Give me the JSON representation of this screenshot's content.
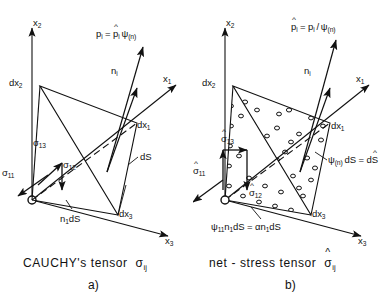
{
  "figure": {
    "title_hidden": "",
    "panels": [
      {
        "id": "a",
        "caption": "CAUCHY's tensor",
        "caption_symbol": "σ",
        "caption_symbol_sub": "ij",
        "sublabel": "a)",
        "axes": [
          {
            "name": "axis-x2",
            "label": "x",
            "sub": "2"
          },
          {
            "name": "axis-x1",
            "label": "x",
            "sub": "1"
          },
          {
            "name": "axis-x3",
            "label": "x",
            "sub": "3"
          }
        ],
        "vertices": [
          {
            "name": "vertex-dx2",
            "label": "dx",
            "sub": "2"
          },
          {
            "name": "vertex-dx1",
            "label": "dx",
            "sub": "1"
          },
          {
            "name": "vertex-dx3",
            "label": "dx",
            "sub": "3"
          }
        ],
        "traction_label": "pᵢ = p̂ᵢ ψ(n)",
        "traction_parts": {
          "lhs": "p",
          "lhs_sub": "i",
          "eq": "=",
          "rhs_sym": "p",
          "rhs_sub": "i",
          "factor": "ψ",
          "factor_sub": "(n)"
        },
        "normal_label": {
          "sym": "n",
          "sub": "i"
        },
        "stress_arrows": [
          {
            "name": "stress-sigma-13",
            "sym": "σ",
            "sub": "13",
            "hat": false
          },
          {
            "name": "stress-sigma-12",
            "sym": "σ",
            "sub": "12",
            "hat": false
          },
          {
            "name": "stress-sigma-11",
            "sym": "σ",
            "sub": "11",
            "hat": false
          }
        ],
        "area_label": "dS",
        "base_label": {
          "sym": "n",
          "sub": "1",
          "tail": "dS"
        },
        "shaded": false
      },
      {
        "id": "b",
        "caption": "net - stress  tensor",
        "caption_symbol": "σ",
        "caption_symbol_sub": "ij",
        "caption_symbol_hat": true,
        "sublabel": "b)",
        "axes": [
          {
            "name": "axis-x2",
            "label": "x",
            "sub": "2"
          },
          {
            "name": "axis-x1",
            "label": "x",
            "sub": "1"
          },
          {
            "name": "axis-x3",
            "label": "x",
            "sub": "3"
          }
        ],
        "vertices": [
          {
            "name": "vertex-dx2",
            "label": "dx",
            "sub": "2"
          },
          {
            "name": "vertex-dx1",
            "label": "dx",
            "sub": "1"
          },
          {
            "name": "vertex-dx3",
            "label": "dx",
            "sub": "3"
          }
        ],
        "traction_label": "p̂ᵢ = pᵢ / ψ(n)",
        "traction_parts": {
          "lhs": "p",
          "lhs_sub": "i",
          "eq": "=",
          "rhs_sym": "p",
          "rhs_sub": "i",
          "slash": "/",
          "factor": "ψ",
          "factor_sub": "(n)"
        },
        "normal_label": {
          "sym": "n",
          "sub": "i"
        },
        "stress_arrows": [
          {
            "name": "stress-sigma-13-hat",
            "sym": "σ",
            "sub": "13",
            "hat": true
          },
          {
            "name": "stress-sigma-12-hat",
            "sym": "σ",
            "sub": "12",
            "hat": true
          },
          {
            "name": "stress-sigma-11-hat",
            "sym": "σ",
            "sub": "11",
            "hat": true
          }
        ],
        "area_label": "ψ(n) dS = dŜ",
        "area_parts": {
          "psi": "ψ",
          "psi_sub": "(n)",
          "dS": "dS",
          "eq": "=",
          "dShat": "dS"
        },
        "base_label": "ψ₁₁n₁dS = αn₁dS",
        "base_parts": {
          "psi": "ψ",
          "psi_sub": "11",
          "n": "n",
          "n_sub": "1",
          "dS": "dS",
          "eq": "=",
          "alpha": "α",
          "n2": "n",
          "n2_sub": "1",
          "dS2": "dS"
        },
        "shaded": true
      }
    ],
    "colors": {
      "ink": "#111111",
      "background": "#ffffff",
      "stipple": "#111111"
    }
  }
}
